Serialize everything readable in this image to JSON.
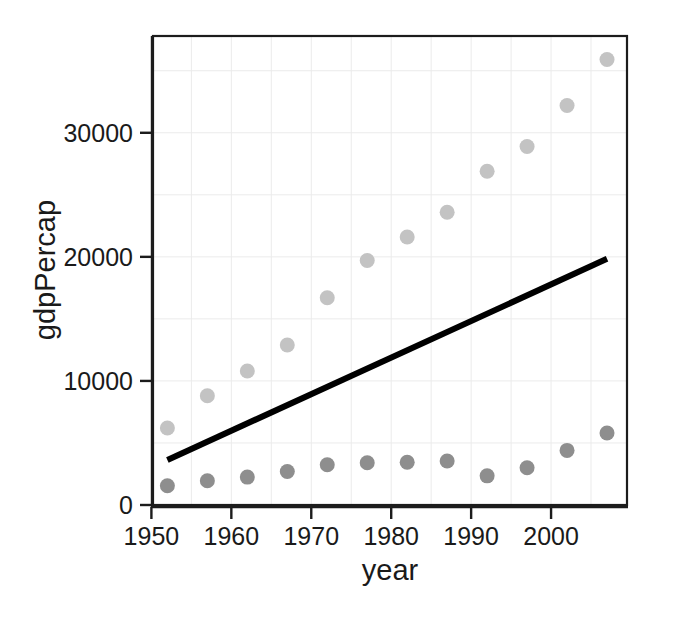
{
  "chart_data": {
    "type": "scatter",
    "title": "",
    "subtitle": "",
    "xlabel": "year",
    "ylabel": "gdpPercap",
    "xlim": [
      1950.2,
      2009.5
    ],
    "ylim": [
      0,
      37800
    ],
    "xticks": [
      "1950",
      "1960",
      "1970",
      "1980",
      "1990",
      "2000"
    ],
    "xtick_values": [
      1950,
      1960,
      1970,
      1980,
      1990,
      2000
    ],
    "yticks": [
      "0",
      "10000",
      "20000",
      "30000"
    ],
    "ytick_values": [
      0,
      10000,
      20000,
      30000
    ],
    "grid": true,
    "grid_color": "#ebebeb",
    "legend": "none",
    "background": "#ffffff",
    "x": [
      1952,
      1957,
      1962,
      1967,
      1972,
      1977,
      1982,
      1987,
      1992,
      1997,
      2002,
      2007
    ],
    "series": [
      {
        "name": "high-gdp-series",
        "color": "#c3c3c3",
        "marker": "circle",
        "marker_size": 15,
        "values": [
          6200,
          8800,
          10800,
          12900,
          16700,
          19700,
          21600,
          23600,
          26900,
          28900,
          32200,
          35900
        ]
      },
      {
        "name": "low-gdp-series",
        "color": "#8e8e8e",
        "marker": "circle",
        "marker_size": 15,
        "values": [
          1550,
          1950,
          2250,
          2700,
          3250,
          3400,
          3450,
          3550,
          2350,
          3000,
          4400,
          5800
        ]
      }
    ],
    "trend_line": {
      "name": "linear-fit",
      "color": "#000000",
      "width": 6,
      "x_start": 1952,
      "y_start": 3630,
      "x_end": 2007,
      "y_end": 19840
    }
  },
  "axes": {
    "x_title": "year",
    "y_title": "gdpPercap",
    "x_tick_labels": [
      "1950",
      "1960",
      "1970",
      "1980",
      "1990",
      "2000"
    ],
    "y_tick_labels": [
      "0",
      "10000",
      "20000",
      "30000"
    ]
  }
}
